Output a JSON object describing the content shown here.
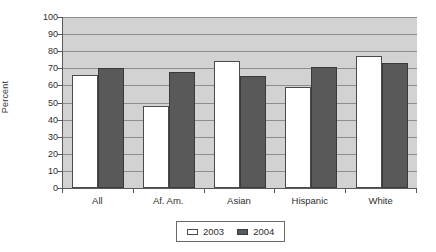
{
  "chart_data": {
    "type": "bar",
    "title": "",
    "subtitle": "",
    "xlabel": "",
    "ylabel": "Percent",
    "ylim": [
      0,
      100
    ],
    "ytick_step": 10,
    "yticks": [
      100,
      90,
      80,
      70,
      60,
      50,
      40,
      30,
      20,
      10,
      0
    ],
    "ytick_labels": [
      "100",
      "90",
      "80",
      "70",
      "60",
      "50",
      "40",
      "30",
      "20",
      "10",
      "0"
    ],
    "grid": true,
    "grid_axis": "y",
    "legend_position": "bottom",
    "categories": [
      "All",
      "Af. Am.",
      "Asian",
      "Hispanic",
      "White"
    ],
    "series": [
      {
        "name": "2003",
        "color": "#ffffff",
        "edge_color": "#4a4a4a",
        "values": [
          66,
          48,
          74,
          59,
          77
        ]
      },
      {
        "name": "2004",
        "color": "#595959",
        "edge_color": "#3a3a3a",
        "values": [
          70,
          68,
          65.5,
          71,
          73
        ]
      }
    ]
  },
  "colors": {
    "plot_background": "#d2d2d2",
    "gridline": "#8d8d8d",
    "axis": "#5a5a5a",
    "text": "#2e2e2e",
    "page_background": "#ffffff"
  }
}
